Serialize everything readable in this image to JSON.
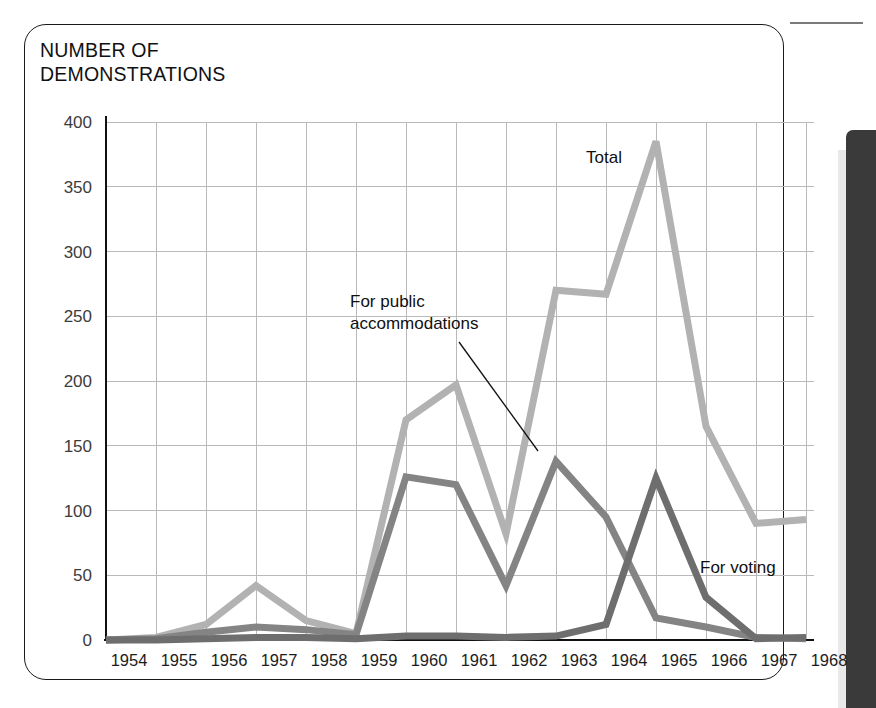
{
  "figure": {
    "title": "NUMBER OF\nDEMONSTRATIONS",
    "frame_color": "#1a1a1a",
    "background": "#ffffff",
    "page_edge_bar_color": "#3a3a3a"
  },
  "chart_data": {
    "type": "line",
    "title": "NUMBER OF DEMONSTRATIONS",
    "xlabel": "",
    "ylabel": "NUMBER OF DEMONSTRATIONS",
    "ylim": [
      0,
      400
    ],
    "xlim": [
      "1954",
      "1968"
    ],
    "grid": true,
    "legend_position": "inline-annotations",
    "categories": [
      "1954",
      "1955",
      "1956",
      "1957",
      "1958",
      "1959",
      "1960",
      "1961",
      "1962",
      "1963",
      "1964",
      "1965",
      "1966",
      "1967",
      "1968"
    ],
    "yticks": [
      0,
      50,
      100,
      150,
      200,
      250,
      300,
      350,
      400
    ],
    "ytick_labels": [
      "0",
      "50",
      "100",
      "150",
      "200",
      "250",
      "300",
      "350",
      "400"
    ],
    "series": [
      {
        "name": "Total",
        "color": "#b2b2b2",
        "stroke_width": 7,
        "values": [
          0,
          2,
          12,
          42,
          15,
          5,
          170,
          197,
          82,
          270,
          267,
          385,
          165,
          90,
          93
        ]
      },
      {
        "name": "For public accommodations",
        "color": "#848484",
        "stroke_width": 7,
        "values": [
          0,
          1,
          6,
          10,
          8,
          4,
          126,
          120,
          42,
          138,
          95,
          17,
          10,
          2,
          1
        ]
      },
      {
        "name": "For voting",
        "color": "#6e6e6e",
        "stroke_width": 7,
        "values": [
          0,
          0,
          1,
          2,
          2,
          1,
          3,
          3,
          2,
          3,
          12,
          125,
          33,
          1,
          2
        ]
      }
    ],
    "annotations": [
      {
        "text": "Total",
        "series": "Total",
        "x": "1963",
        "value": 385
      },
      {
        "text": "For public\naccommodations",
        "series": "For public accommodations",
        "x": "1960",
        "value": 138
      },
      {
        "text": "For voting",
        "series": "For voting",
        "x": "1966",
        "value": 125
      }
    ]
  },
  "annotations": {
    "total_label": "Total",
    "public_accommodations_label_line1": "For public",
    "public_accommodations_label_line2": "accommodations",
    "voting_label": "For voting"
  }
}
